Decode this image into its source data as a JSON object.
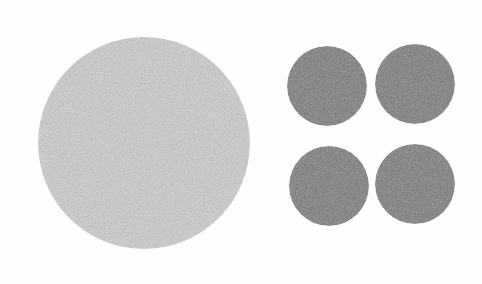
{
  "image": {
    "title": "Grainy gray discs on white background",
    "width": 482,
    "height": 284,
    "background_color": "#ffffff",
    "texture": "speckled-noise"
  },
  "palette": {
    "background": "#ffffff",
    "large_disc_fill": "#cccccc",
    "small_disc_fill": "#7c7c7c",
    "grain_dark": "#9a9a9a",
    "grain_light": "#f2f2f2"
  },
  "shapes": [
    {
      "id": "large-disc",
      "label": "Large light gray disc",
      "cx": 144,
      "cy": 143,
      "r": 106,
      "fill": "#cccccc",
      "noise": "high"
    },
    {
      "id": "small-disc-top-left",
      "label": "Small gray disc top-left",
      "cx": 327,
      "cy": 86,
      "r": 40,
      "fill": "#7c7c7c",
      "noise": "high"
    },
    {
      "id": "small-disc-top-right",
      "label": "Small gray disc top-right",
      "cx": 415,
      "cy": 84,
      "r": 40,
      "fill": "#7c7c7c",
      "noise": "high"
    },
    {
      "id": "small-disc-bottom-left",
      "label": "Small gray disc bottom-left",
      "cx": 329,
      "cy": 186,
      "r": 40,
      "fill": "#7c7c7c",
      "noise": "high"
    },
    {
      "id": "small-disc-bottom-right",
      "label": "Small gray disc bottom-right",
      "cx": 415,
      "cy": 184,
      "r": 40,
      "fill": "#7c7c7c",
      "noise": "high"
    }
  ]
}
